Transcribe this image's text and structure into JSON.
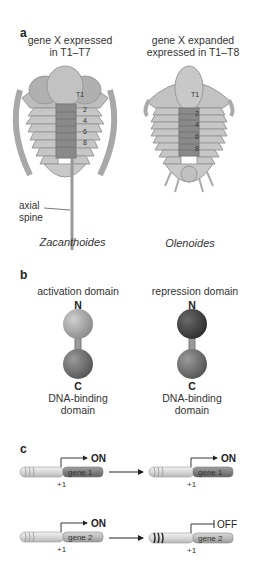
{
  "panel_a": {
    "label": "a",
    "left": {
      "caption_line1": "gene X expressed",
      "caption_line2": "in T1–T7",
      "species": "Zacanthoides",
      "spine_label_line1": "axial",
      "spine_label_line2": "spine",
      "segment_labels": [
        "T1",
        "2",
        "4",
        "6",
        "8"
      ]
    },
    "right": {
      "caption_line1": "gene X expanded",
      "caption_line2": "expressed in T1–T8",
      "species": "Olenoides",
      "segment_labels": [
        "T1",
        "2",
        "4",
        "6",
        "8"
      ]
    }
  },
  "panel_b": {
    "label": "b",
    "left": {
      "top_label": "activation domain",
      "n_label": "N",
      "c_label": "C",
      "bottom_line1": "DNA-binding",
      "bottom_line2": "domain",
      "top_ball_color": "#9a9a9a",
      "bottom_ball_color": "#6a6a6a"
    },
    "right": {
      "top_label": "repression domain",
      "n_label": "N",
      "c_label": "C",
      "bottom_line1": "DNA-binding",
      "bottom_line2": "domain",
      "top_ball_color": "#444444",
      "bottom_ball_color": "#6a6a6a"
    }
  },
  "panel_c": {
    "label": "c",
    "rows": [
      {
        "before": {
          "gene": "gene 1",
          "state": "ON",
          "position": "+1"
        },
        "after": {
          "gene": "gene 1",
          "state": "ON",
          "position": "+1"
        }
      },
      {
        "before": {
          "gene": "gene 2",
          "state": "ON",
          "position": "+1"
        },
        "after": {
          "gene": "gene 2",
          "state": "OFF",
          "position": "+1"
        }
      }
    ]
  }
}
